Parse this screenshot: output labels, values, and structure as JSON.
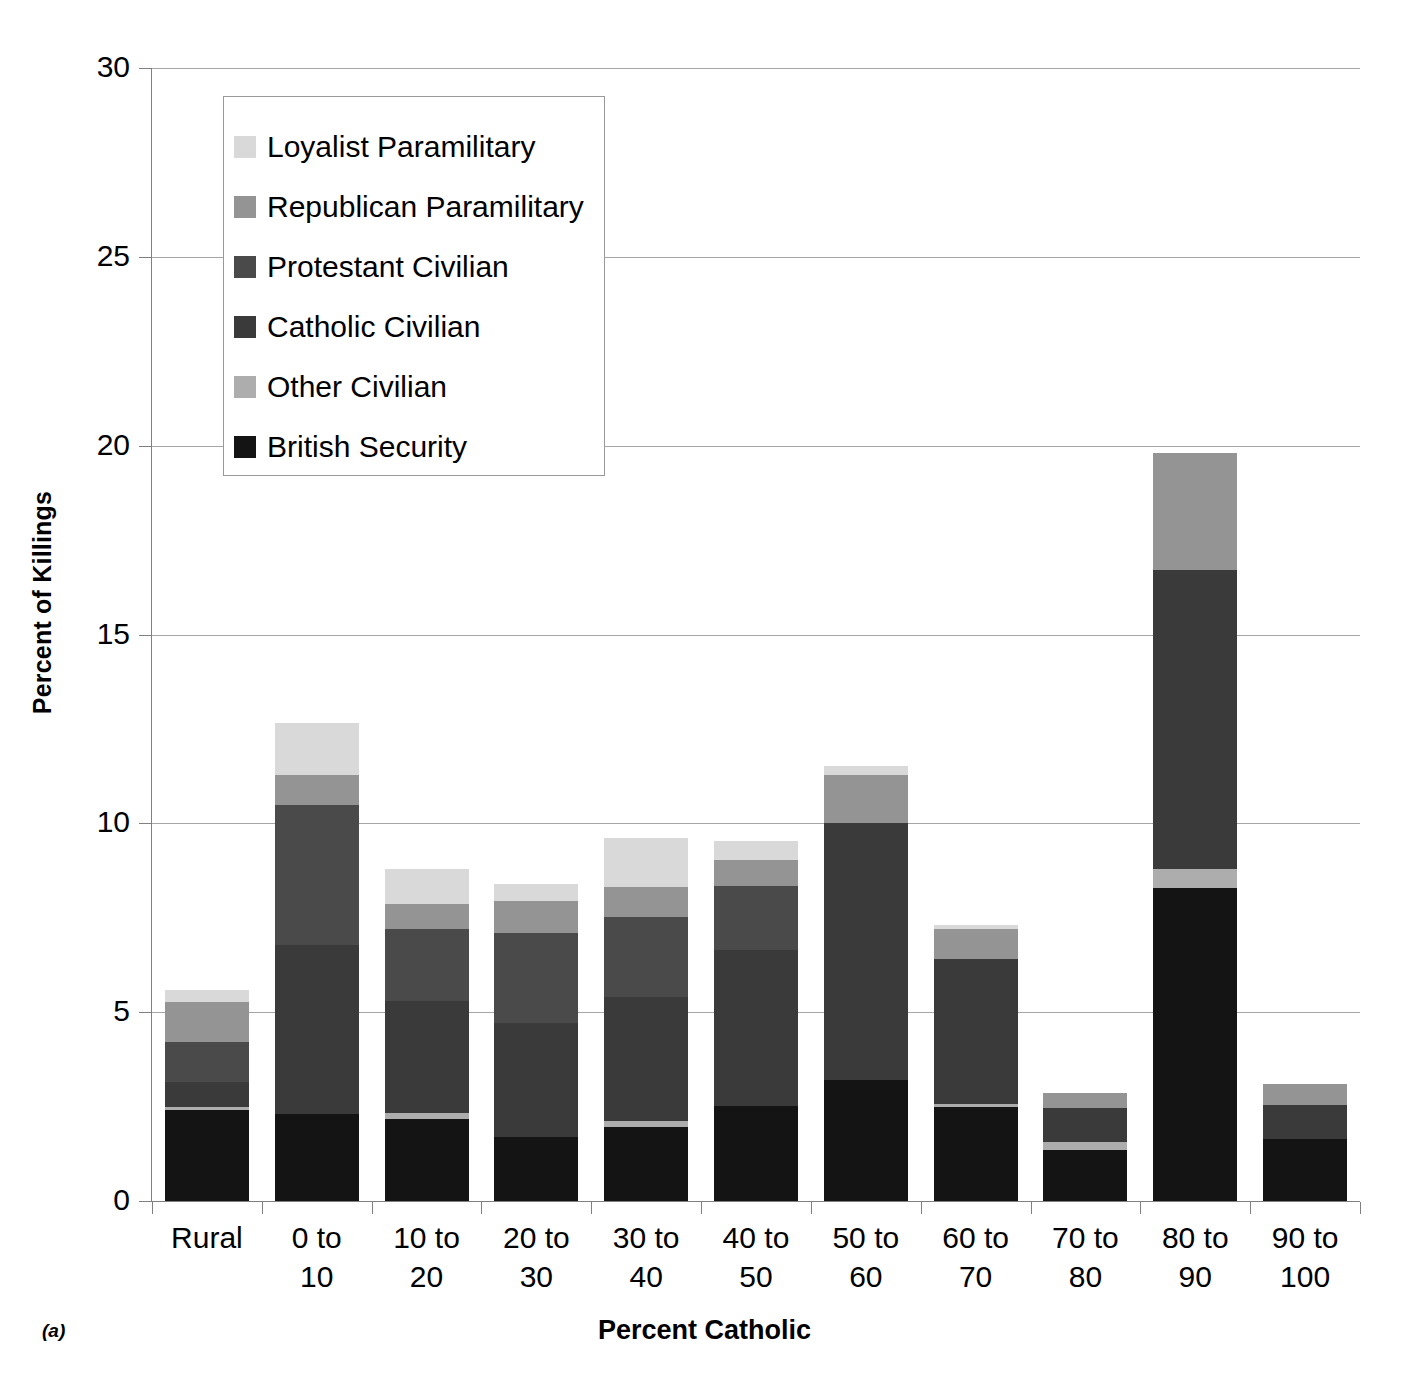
{
  "panel_tag": "(a)",
  "axes": {
    "ytitle": "Percent of Killings",
    "xtitle": "Percent Catholic",
    "yticks": [
      "0",
      "5",
      "10",
      "15",
      "20",
      "25",
      "30"
    ]
  },
  "legend": {
    "items": [
      {
        "label": "Loyalist Paramilitary",
        "color": "#d9d9d9"
      },
      {
        "label": "Republican Paramilitary",
        "color": "#949494"
      },
      {
        "label": "Protestant Civilian",
        "color": "#4a4a4a"
      },
      {
        "label": "Catholic Civilian",
        "color": "#3a3a3a"
      },
      {
        "label": "Other Civilian",
        "color": "#adadad"
      },
      {
        "label": "British Security",
        "color": "#141414"
      }
    ]
  },
  "chart_data": {
    "type": "bar",
    "subtype": "stacked",
    "title": "",
    "xlabel": "Percent Catholic",
    "ylabel": "Percent of Killings",
    "ylim": [
      0,
      30
    ],
    "ytick_step": 5,
    "grid": true,
    "legend_position": "inside-top-left",
    "categories": [
      "Rural",
      "0 to 10",
      "10 to 20",
      "20 to 30",
      "30 to 40",
      "40 to 50",
      "50 to 60",
      "60 to 70",
      "70 to 80",
      "80 to 90",
      "90 to 100"
    ],
    "stack_order_bottom_to_top": [
      "British Security",
      "Other Civilian",
      "Catholic Civilian",
      "Protestant Civilian",
      "Republican Paramilitary",
      "Loyalist Paramilitary"
    ],
    "series": [
      {
        "name": "British Security",
        "color": "#141414",
        "values": [
          2.41,
          2.3,
          2.17,
          1.7,
          1.96,
          2.51,
          3.2,
          2.49,
          1.35,
          8.29,
          1.64
        ]
      },
      {
        "name": "Other Civilian",
        "color": "#adadad",
        "values": [
          0.08,
          0.0,
          0.16,
          0.0,
          0.16,
          0.0,
          0.0,
          0.08,
          0.21,
          0.5,
          0.0
        ]
      },
      {
        "name": "Catholic Civilian",
        "color": "#3a3a3a",
        "values": [
          0.66,
          4.48,
          2.97,
          3.02,
          3.28,
          4.14,
          6.81,
          3.84,
          0.9,
          7.93,
          0.9
        ]
      },
      {
        "name": "Protestant Civilian",
        "color": "#4a4a4a",
        "values": [
          1.06,
          3.71,
          1.9,
          2.38,
          2.12,
          1.69,
          0.0,
          0.0,
          0.0,
          0.0,
          0.0
        ]
      },
      {
        "name": "Republican Paramilitary",
        "color": "#949494",
        "values": [
          1.06,
          0.8,
          0.66,
          0.85,
          0.79,
          0.69,
          1.27,
          0.79,
          0.4,
          3.08,
          0.56
        ]
      },
      {
        "name": "Loyalist Paramilitary",
        "color": "#d9d9d9",
        "values": [
          0.32,
          1.37,
          0.93,
          0.45,
          1.3,
          0.5,
          0.24,
          0.11,
          0.0,
          0.0,
          0.0
        ]
      }
    ],
    "totals": [
      5.59,
      12.66,
      8.79,
      8.4,
      9.61,
      9.53,
      11.52,
      7.31,
      2.86,
      19.8,
      3.1
    ]
  }
}
